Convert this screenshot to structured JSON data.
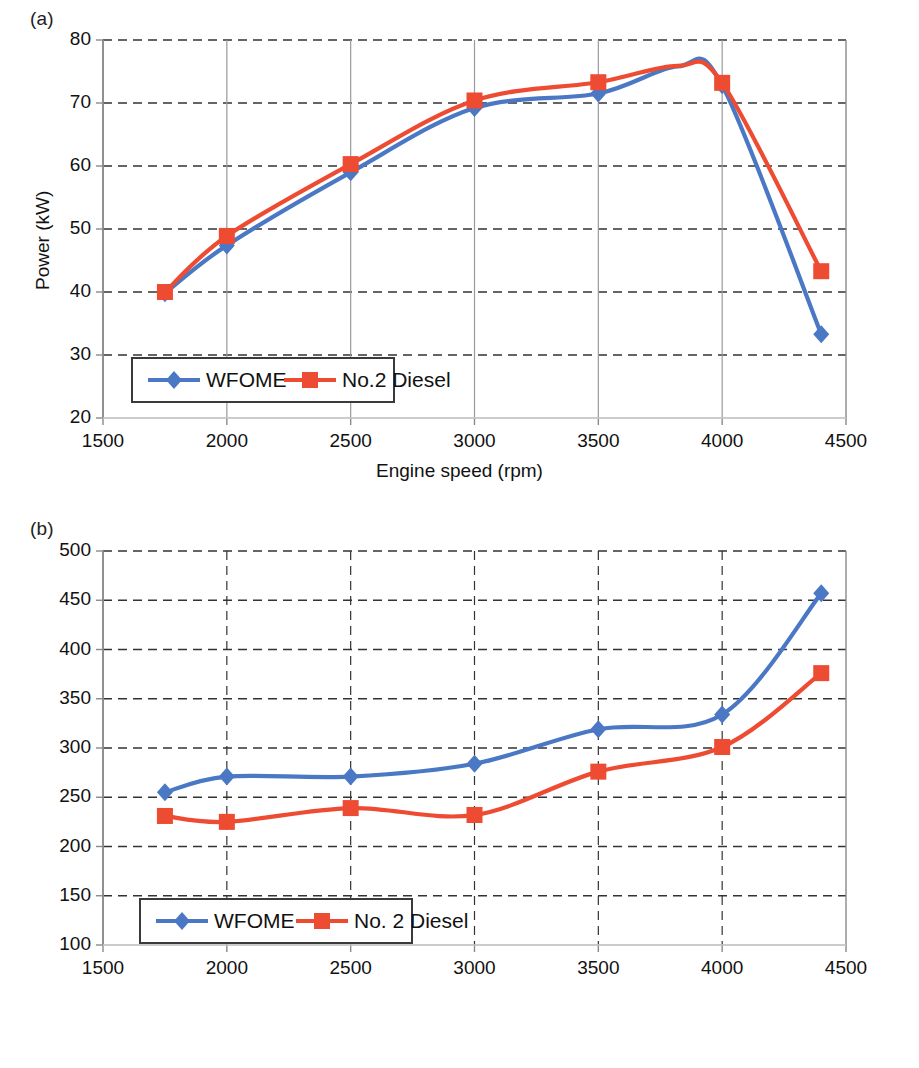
{
  "colors": {
    "wfome": "#4a78c4",
    "diesel": "#ee4b33",
    "axis": "#8a8a8a",
    "grid": "#333333",
    "text": "#111111"
  },
  "panels": [
    {
      "id": "a",
      "label": "(a)",
      "xlabel": "Engine speed (rpm)",
      "ylabel": "Power (kW)",
      "ylabel_sup": "",
      "xticks": [
        "1500",
        "2000",
        "2500",
        "3000",
        "3500",
        "4000",
        "4500"
      ],
      "yticks": [
        "20",
        "30",
        "40",
        "50",
        "60",
        "70",
        "80"
      ],
      "legend": [
        "WFOME",
        "No.2 Diesel"
      ]
    },
    {
      "id": "b",
      "label": "(b)",
      "xlabel": "Engine speed (rpm)",
      "ylabel": "Brake-specific fuel consumption (g kWh",
      "ylabel_sup": "−1",
      "ylabel_tail": ")",
      "xticks": [
        "1500",
        "2000",
        "2500",
        "3000",
        "3500",
        "4000",
        "4500"
      ],
      "yticks": [
        "100",
        "150",
        "200",
        "250",
        "300",
        "350",
        "400",
        "450",
        "500"
      ],
      "legend": [
        "WFOME",
        "No. 2 Diesel"
      ]
    }
  ],
  "chart_data": [
    {
      "type": "line",
      "panel": "(a)",
      "title": "",
      "xlabel": "Engine speed (rpm)",
      "ylabel": "Power (kW)",
      "xlim": [
        1500,
        4500
      ],
      "ylim": [
        20,
        80
      ],
      "xticks": [
        1500,
        2000,
        2500,
        3000,
        3500,
        4000,
        4500
      ],
      "yticks": [
        20,
        30,
        40,
        50,
        60,
        70,
        80
      ],
      "grid": true,
      "legend_position": "lower-left-inside",
      "series": [
        {
          "name": "WFOME",
          "color": "#4a78c4",
          "marker": "diamond",
          "x": [
            1750,
            2000,
            2500,
            3000,
            3500,
            3820,
            4000,
            4400
          ],
          "y": [
            39.8,
            47.4,
            59.0,
            69.2,
            71.5,
            75.8,
            72.8,
            33.3
          ]
        },
        {
          "name": "No.2 Diesel",
          "color": "#ee4b33",
          "marker": "square",
          "x": [
            1750,
            2000,
            2500,
            3000,
            3500,
            3820,
            4000,
            4400
          ],
          "y": [
            40.0,
            48.9,
            60.3,
            70.4,
            73.3,
            75.9,
            73.2,
            43.3
          ]
        }
      ]
    },
    {
      "type": "line",
      "panel": "(b)",
      "title": "",
      "xlabel": "Engine speed (rpm)",
      "ylabel": "Brake-specific fuel consumption (g kWh⁻¹)",
      "xlim": [
        1500,
        4500
      ],
      "ylim": [
        100,
        500
      ],
      "xticks": [
        1500,
        2000,
        2500,
        3000,
        3500,
        4000,
        4500
      ],
      "yticks": [
        100,
        150,
        200,
        250,
        300,
        350,
        400,
        450,
        500
      ],
      "grid": true,
      "legend_position": "lower-left-inside",
      "series": [
        {
          "name": "WFOME",
          "color": "#4a78c4",
          "marker": "diamond",
          "x": [
            1750,
            2000,
            2500,
            3000,
            3500,
            4000,
            4400
          ],
          "y": [
            255,
            271,
            271,
            284,
            319,
            334,
            457
          ]
        },
        {
          "name": "No. 2 Diesel",
          "color": "#ee4b33",
          "marker": "square",
          "x": [
            1750,
            2000,
            2500,
            3000,
            3500,
            4000,
            4400
          ],
          "y": [
            231,
            225,
            239,
            232,
            276,
            301,
            376
          ]
        }
      ]
    }
  ]
}
